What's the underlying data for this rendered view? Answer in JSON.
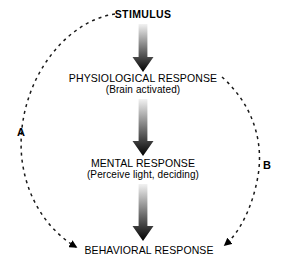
{
  "diagram": {
    "background_color": "#ffffff",
    "ink_color": "#000000",
    "nodes": [
      {
        "id": "stimulus",
        "title": "STIMULUS",
        "subtitle": "",
        "bold": true,
        "x": 143,
        "y": 15
      },
      {
        "id": "physiological",
        "title": "PHYSIOLOGICAL RESPONSE",
        "subtitle": "(Brain activated)",
        "bold": false,
        "x": 143,
        "y": 79
      },
      {
        "id": "mental",
        "title": "MENTAL RESPONSE",
        "subtitle": "(Perceive light, deciding)",
        "bold": false,
        "x": 143,
        "y": 164
      },
      {
        "id": "behavioral",
        "title": "BEHAVIORAL RESPONSE",
        "subtitle": "",
        "bold": false,
        "x": 149,
        "y": 251
      }
    ],
    "arrows": [
      {
        "id": "stimulus-to-physiological",
        "from": "stimulus",
        "to": "physiological",
        "top": 24,
        "shaft_height": 33,
        "head_height": 15,
        "gradient_start": "#f2f2f2",
        "gradient_end": "#000000"
      },
      {
        "id": "physiological-to-mental",
        "from": "physiological",
        "to": "mental",
        "top": 99,
        "shaft_height": 42,
        "head_height": 15,
        "gradient_start": "#f2f2f2",
        "gradient_end": "#000000"
      },
      {
        "id": "mental-to-behavioral",
        "from": "mental",
        "to": "behavioral",
        "top": 184,
        "shaft_height": 42,
        "head_height": 15,
        "gradient_start": "#f2f2f2",
        "gradient_end": "#000000"
      }
    ],
    "feedback_loops": [
      {
        "id": "loop-a",
        "label": "A",
        "label_x": 17,
        "label_y": 127,
        "from": "stimulus",
        "to": "behavioral",
        "style": "dashed",
        "path": "M 115 14 C 60 22, 14 90, 22 160 C 28 206, 54 234, 76 247",
        "dash_pattern": "3 4"
      },
      {
        "id": "loop-b",
        "label": "B",
        "label_x": 263,
        "label_y": 160,
        "from": "physiological",
        "to": "behavioral",
        "style": "dashed",
        "path": "M 222 77 C 252 104, 264 140, 258 176 C 252 210, 238 234, 225 245",
        "dash_pattern": "3 4"
      }
    ]
  }
}
